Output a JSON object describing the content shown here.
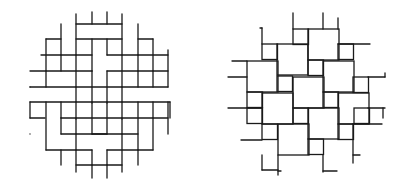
{
  "figure": {
    "panels": [
      {
        "id": "left",
        "description": "basket weave pattern clipped to a circle",
        "line_color": "#1a1a1a",
        "segments": [
          [
            61,
            24,
            61,
            55
          ],
          [
            76,
            14,
            76,
            55
          ],
          [
            92,
            12,
            92,
            24
          ],
          [
            107,
            12,
            107,
            24
          ],
          [
            122,
            14,
            122,
            55
          ],
          [
            138,
            24,
            138,
            55
          ],
          [
            76,
            24,
            122,
            24
          ],
          [
            76,
            39,
            122,
            39
          ],
          [
            46,
            39,
            61,
            39
          ],
          [
            138,
            39,
            153,
            39
          ],
          [
            41,
            55,
            92,
            55
          ],
          [
            107,
            55,
            168,
            55
          ],
          [
            46,
            39,
            46,
            87
          ],
          [
            92,
            39,
            92,
            71
          ],
          [
            107,
            39,
            107,
            55
          ],
          [
            153,
            39,
            153,
            87
          ],
          [
            168,
            50,
            168,
            87
          ],
          [
            46,
            71,
            92,
            71
          ],
          [
            107,
            71,
            153,
            71
          ],
          [
            30,
            87,
            76,
            87
          ],
          [
            122,
            87,
            168,
            87
          ],
          [
            30,
            71,
            46,
            71
          ],
          [
            153,
            71,
            168,
            71
          ],
          [
            61,
            55,
            61,
            71
          ],
          [
            76,
            55,
            76,
            119
          ],
          [
            92,
            71,
            92,
            103
          ],
          [
            107,
            71,
            107,
            103
          ],
          [
            122,
            55,
            122,
            119
          ],
          [
            138,
            55,
            138,
            71
          ],
          [
            138,
            71,
            138,
            87
          ],
          [
            30,
            102,
            76,
            102
          ],
          [
            122,
            102,
            170,
            102
          ],
          [
            76,
            87,
            122,
            87
          ],
          [
            76,
            102,
            122,
            102
          ],
          [
            30,
            87,
            30,
            87
          ],
          [
            61,
            102,
            61,
            118
          ],
          [
            92,
            102,
            92,
            134
          ],
          [
            107,
            102,
            107,
            134
          ],
          [
            138,
            102,
            138,
            150
          ],
          [
            46,
            102,
            46,
            150
          ],
          [
            153,
            102,
            153,
            150
          ],
          [
            168,
            102,
            168,
            134
          ],
          [
            30,
            118,
            45,
            118
          ],
          [
            153,
            118,
            168,
            118
          ],
          [
            61,
            118,
            153,
            118
          ],
          [
            61,
            118,
            61,
            134
          ],
          [
            76,
            118,
            76,
            134
          ],
          [
            122,
            118,
            122,
            134
          ],
          [
            61,
            134,
            107,
            134
          ],
          [
            92,
            134,
            138,
            134
          ],
          [
            46,
            150,
            92,
            150
          ],
          [
            107,
            150,
            153,
            150
          ],
          [
            76,
            134,
            76,
            172
          ],
          [
            92,
            150,
            92,
            165
          ],
          [
            107,
            150,
            107,
            165
          ],
          [
            122,
            134,
            122,
            172
          ],
          [
            76,
            165,
            122,
            165
          ],
          [
            76,
            150,
            76,
            150
          ],
          [
            92,
            165,
            92,
            178
          ],
          [
            107,
            165,
            107,
            178
          ],
          [
            61,
            150,
            61,
            165
          ],
          [
            138,
            150,
            138,
            165
          ],
          [
            30,
            134,
            30,
            134
          ],
          [
            30,
            102,
            30,
            118
          ],
          [
            170,
            102,
            170,
            118
          ]
        ]
      },
      {
        "id": "right",
        "description": "pinwheel tiling of large and small squares",
        "line_color": "#1a1a1a",
        "big_squares": [
          [
            308,
            29
          ],
          [
            277,
            44
          ],
          [
            323,
            61
          ],
          [
            247,
            61
          ],
          [
            293,
            77
          ],
          [
            262,
            93
          ],
          [
            338,
            93
          ],
          [
            308,
            108
          ],
          [
            278,
            124
          ]
        ],
        "small_squares": [
          [
            293,
            29
          ],
          [
            262,
            44
          ],
          [
            338,
            44
          ],
          [
            308,
            60
          ],
          [
            247,
            92
          ],
          [
            277,
            76
          ],
          [
            353,
            77
          ],
          [
            323,
            92
          ],
          [
            293,
            108
          ],
          [
            262,
            124
          ],
          [
            338,
            124
          ],
          [
            308,
            139
          ],
          [
            247,
            108
          ],
          [
            354,
            108
          ]
        ],
        "segments": [
          [
            293,
            13,
            293,
            29
          ],
          [
            323,
            13,
            323,
            29
          ],
          [
            338,
            18,
            338,
            29
          ],
          [
            260,
            28,
            262,
            28
          ],
          [
            262,
            28,
            262,
            44
          ],
          [
            338,
            44,
            370,
            44
          ],
          [
            232,
            61,
            247,
            61
          ],
          [
            228,
            77,
            247,
            77
          ],
          [
            228,
            108,
            262,
            108
          ],
          [
            241,
            140,
            262,
            140
          ],
          [
            368,
            77,
            385,
            77
          ],
          [
            385,
            73,
            385,
            77
          ],
          [
            368,
            108,
            385,
            108
          ],
          [
            383,
            108,
            383,
            118
          ],
          [
            353,
            124,
            382,
            124
          ],
          [
            353,
            124,
            353,
            163
          ],
          [
            353,
            155,
            360,
            155
          ],
          [
            323,
            155,
            323,
            172
          ],
          [
            323,
            171,
            337,
            171
          ],
          [
            278,
            155,
            278,
            175
          ],
          [
            278,
            171,
            281,
            171
          ],
          [
            262,
            155,
            262,
            170
          ],
          [
            262,
            170,
            278,
            170
          ]
        ]
      }
    ]
  }
}
